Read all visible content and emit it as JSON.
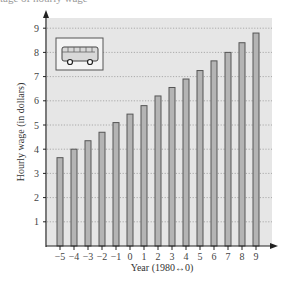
{
  "top_caption": "tage of hourly wage",
  "chart_data": {
    "type": "bar",
    "title": "",
    "xlabel": "Year (1980↔0)",
    "ylabel": "Hourly wage (in dollars)",
    "categories": [
      "−5",
      "−4",
      "−3",
      "−2",
      "−1",
      "0",
      "1",
      "2",
      "3",
      "4",
      "5",
      "6",
      "7",
      "8",
      "9"
    ],
    "x": [
      -5,
      -4,
      -3,
      -2,
      -1,
      0,
      1,
      2,
      3,
      4,
      5,
      6,
      7,
      8,
      9
    ],
    "values": [
      3.65,
      4.0,
      4.35,
      4.7,
      5.1,
      5.45,
      5.8,
      6.2,
      6.55,
      6.9,
      7.25,
      7.65,
      8.0,
      8.4,
      8.8
    ],
    "yticks": [
      1,
      2,
      3,
      4,
      5,
      6,
      7,
      8,
      9
    ],
    "ylim": [
      0,
      9.6
    ],
    "grid": true,
    "grid_style": "dotted horizontal",
    "legend": "none",
    "annotation": "bus-icon",
    "colors": {
      "bar_fill": "#b4b4b4",
      "bar_stroke": "#555555",
      "plot_bg": "#e6e6e6",
      "grid": "#9a9a9a",
      "axis": "#222222"
    }
  }
}
